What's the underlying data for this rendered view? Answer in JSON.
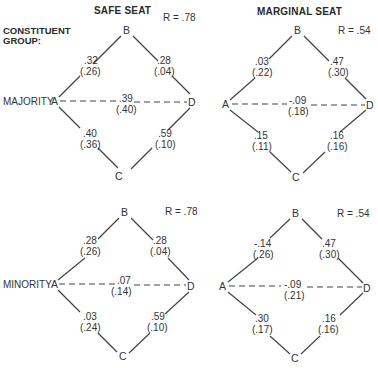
{
  "headers": {
    "safe": "SAFE SEAT",
    "marginal": "MARGINAL SEAT",
    "group_line1": "CONSTITUENT",
    "group_line2": "GROUP:"
  },
  "rows": {
    "majority": "MAJORITY",
    "minority": "MINORITY"
  },
  "panels": {
    "maj_safe": {
      "R": "R = .78",
      "AB": ".32",
      "AB_p": "(.26)",
      "BD": ".28",
      "BD_p": "(.04)",
      "AD": ".39",
      "AD_p": "(.40)",
      "AC": ".40",
      "AC_p": "(.36)",
      "CD": ".59",
      "CD_p": "(.10)"
    },
    "maj_marg": {
      "R": "R = .54",
      "AB": ".03",
      "AB_p": "(.22)",
      "BD": ".47",
      "BD_p": "(.30)",
      "AD": "-.09",
      "AD_p": "(.18)",
      "AC": ".15",
      "AC_p": "(.11)",
      "CD": ".16",
      "CD_p": "(.16)"
    },
    "min_safe": {
      "R": "R = .78",
      "AB": ".28",
      "AB_p": "(.26)",
      "BD": ".28",
      "BD_p": "(.04)",
      "AD": ".07",
      "AD_p": "(.14)",
      "AC": ".03",
      "AC_p": "(.24)",
      "CD": ".59",
      "CD_p": "(.10)"
    },
    "min_marg": {
      "R": "R = .54",
      "AB": "-.14",
      "AB_p": "(.26)",
      "BD": ".47",
      "BD_p": "(.30)",
      "AD": "-.09",
      "AD_p": "(.21)",
      "AC": ".30",
      "AC_p": "(.17)",
      "CD": ".16",
      "CD_p": "(.16)"
    }
  },
  "nodes": {
    "A": "A",
    "B": "B",
    "C": "C",
    "D": "D"
  }
}
